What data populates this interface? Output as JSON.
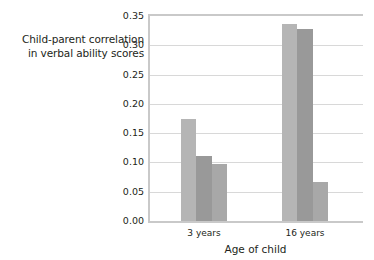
{
  "chart_data": {
    "type": "bar",
    "title": "",
    "xlabel": "Age of child",
    "ylabel": "Child-parent correlation in verbal ability scores",
    "ylabel_lines": [
      "Child-parent correlation",
      "in verbal ability scores"
    ],
    "categories": [
      "3 years",
      "16 years"
    ],
    "series": [
      {
        "name": "series-1",
        "color": "#b5b5b5",
        "values": [
          0.174,
          0.337
        ]
      },
      {
        "name": "series-2",
        "color": "#999999",
        "values": [
          0.111,
          0.327
        ]
      },
      {
        "name": "series-3",
        "color": "#a8a8a8",
        "values": [
          0.097,
          0.067
        ]
      }
    ],
    "ylim": [
      0.0,
      0.35
    ],
    "ytick_values": [
      0.0,
      0.05,
      0.1,
      0.15,
      0.2,
      0.25,
      0.3,
      0.35
    ],
    "ytick_labels": [
      "0.00",
      "0.05",
      "0.10",
      "0.15",
      "0.20",
      "0.25",
      "0.30",
      "0.35"
    ],
    "grid": true,
    "grid_axis": "y",
    "legend": false,
    "legend_position": "none",
    "background": "#ffffff",
    "axis_color": "#c9c9c9",
    "grid_color": "#d8d8d8",
    "text_color": "#231f20"
  }
}
